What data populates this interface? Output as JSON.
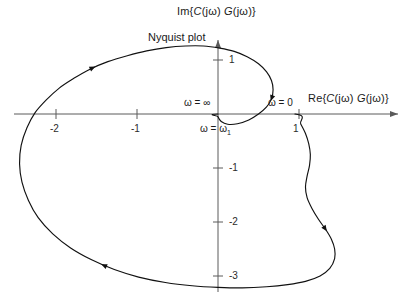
{
  "figure": {
    "title": "Nyquist plot",
    "y_axis_label": "Im{C(jω) G(jω)}",
    "x_axis_label": "Re{C(jω) G(jω)}",
    "im_label_parts": {
      "pre": "Im{",
      "f1": "C",
      "arg1": "(jω)",
      "gap": " ",
      "f2": "G",
      "arg2": "(jω)",
      "post": "}"
    },
    "re_label_parts": {
      "pre": "Re{",
      "f1": "C",
      "arg1": "(jω)",
      "gap": " ",
      "f2": "G",
      "arg2": "(jω)",
      "post": "}"
    }
  },
  "annotations": [
    {
      "id": "omega-infinity",
      "text": "ω = ∞"
    },
    {
      "id": "omega-zero",
      "text": "ω = 0"
    },
    {
      "id": "omega-one",
      "text_pre": "ω = ω",
      "text_sub": "1"
    }
  ],
  "axes": {
    "x_ticks": [
      {
        "value": -2,
        "label": "-2"
      },
      {
        "value": -1,
        "label": "-1"
      },
      {
        "value": 1,
        "label": "1"
      }
    ],
    "y_ticks": [
      {
        "value": 1,
        "label": "1"
      },
      {
        "value": -1,
        "label": "-1"
      },
      {
        "value": -2,
        "label": "-2"
      },
      {
        "value": -3,
        "label": "-3"
      }
    ],
    "x_range": [
      -2.7,
      2.4
    ],
    "y_range": [
      -3.5,
      1.55
    ],
    "grid": false,
    "origin_px": [
      218,
      114
    ],
    "px_per_unit_x": 81,
    "px_per_unit_y": 54
  },
  "chart_data": {
    "type": "line",
    "title": "Nyquist plot",
    "xlabel": "Re{C(jω) G(jω)}",
    "ylabel": "Im{C(jω) G(jω)}",
    "xlim": [
      -2.7,
      2.4
    ],
    "ylim": [
      -3.5,
      1.55
    ],
    "grid": false,
    "legend": null,
    "annotations": [
      {
        "label": "ω = 0",
        "x": 0.95,
        "y": 0.0
      },
      {
        "label": "ω = ∞",
        "x": 0.0,
        "y": 0.0
      },
      {
        "label": "ω = ω₁",
        "x": 0.28,
        "y": -0.28
      }
    ],
    "series": [
      {
        "name": "C(jω)G(jω) locus",
        "closed": true,
        "direction_arrows": [
          {
            "x": -1.55,
            "y": 0.84
          },
          {
            "x": 0.52,
            "y": 0.36
          },
          {
            "x": -1.4,
            "y": -2.75
          },
          {
            "x": 1.37,
            "y": -2.08
          }
        ],
        "points": [
          [
            0.95,
            0.0
          ],
          [
            1.02,
            -0.18
          ],
          [
            1.08,
            -0.36
          ],
          [
            1.12,
            -0.55
          ],
          [
            1.14,
            -0.75
          ],
          [
            1.13,
            -0.95
          ],
          [
            1.1,
            -1.15
          ],
          [
            1.08,
            -1.35
          ],
          [
            1.1,
            -1.55
          ],
          [
            1.16,
            -1.75
          ],
          [
            1.24,
            -1.95
          ],
          [
            1.33,
            -2.14
          ],
          [
            1.4,
            -2.32
          ],
          [
            1.44,
            -2.5
          ],
          [
            1.44,
            -2.68
          ],
          [
            1.38,
            -2.86
          ],
          [
            1.26,
            -3.0
          ],
          [
            1.08,
            -3.1
          ],
          [
            0.86,
            -3.16
          ],
          [
            0.6,
            -3.2
          ],
          [
            0.3,
            -3.22
          ],
          [
            0.0,
            -3.21
          ],
          [
            -0.32,
            -3.18
          ],
          [
            -0.65,
            -3.12
          ],
          [
            -0.98,
            -3.02
          ],
          [
            -1.28,
            -2.88
          ],
          [
            -1.56,
            -2.7
          ],
          [
            -1.82,
            -2.48
          ],
          [
            -2.04,
            -2.22
          ],
          [
            -2.22,
            -1.92
          ],
          [
            -2.34,
            -1.6
          ],
          [
            -2.42,
            -1.26
          ],
          [
            -2.45,
            -0.92
          ],
          [
            -2.43,
            -0.58
          ],
          [
            -2.36,
            -0.26
          ],
          [
            -2.26,
            0.02
          ],
          [
            -2.12,
            0.26
          ],
          [
            -1.96,
            0.48
          ],
          [
            -1.78,
            0.66
          ],
          [
            -1.58,
            0.83
          ],
          [
            -1.36,
            0.97
          ],
          [
            -1.12,
            1.08
          ],
          [
            -0.88,
            1.17
          ],
          [
            -0.64,
            1.23
          ],
          [
            -0.4,
            1.26
          ],
          [
            -0.18,
            1.26
          ],
          [
            0.02,
            1.22
          ],
          [
            0.2,
            1.16
          ],
          [
            0.36,
            1.06
          ],
          [
            0.5,
            0.93
          ],
          [
            0.6,
            0.78
          ],
          [
            0.66,
            0.62
          ],
          [
            0.68,
            0.45
          ],
          [
            0.66,
            0.28
          ],
          [
            0.6,
            0.13
          ],
          [
            0.5,
            0.0
          ],
          [
            0.38,
            -0.11
          ],
          [
            0.24,
            -0.18
          ],
          [
            0.12,
            -0.19
          ],
          [
            0.04,
            -0.14
          ],
          [
            0.0,
            -0.05
          ],
          [
            0.0,
            0.0
          ]
        ]
      }
    ]
  }
}
